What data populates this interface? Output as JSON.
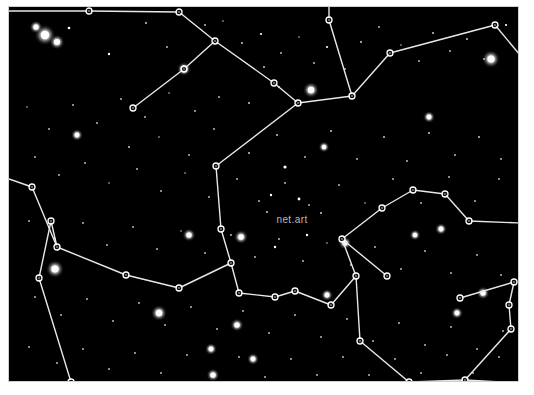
{
  "image": {
    "title": "net.art constellation star chart",
    "width": 534,
    "height": 395,
    "background_color": "#ffffff",
    "sky_color": "#000000",
    "frame_color": "#cfcfcf",
    "line_color": "#e8e8e8",
    "node_stroke_color": "#ffffff",
    "star_color": "#ffffff",
    "label_color": "#b9b9b9"
  },
  "frame": {
    "x": 8,
    "y": 6,
    "width": 511,
    "height": 376
  },
  "labels": [
    {
      "text": "net.art",
      "x": 283,
      "y": 216,
      "size": 10,
      "anchor": "middle"
    }
  ],
  "chart_data": {
    "type": "scatter",
    "title": "net.art",
    "xlabel": "",
    "ylabel": "",
    "xlim": [
      0,
      511
    ],
    "ylim": [
      0,
      376
    ],
    "grid": false,
    "legend": null,
    "nodes": [
      {
        "id": "n1",
        "x": 80,
        "y": 4
      },
      {
        "id": "n2",
        "x": 170,
        "y": 5
      },
      {
        "id": "n3",
        "x": 206,
        "y": 34
      },
      {
        "id": "n4",
        "x": 175,
        "y": 62
      },
      {
        "id": "n5",
        "x": 124,
        "y": 101
      },
      {
        "id": "n6",
        "x": 265,
        "y": 76
      },
      {
        "id": "n7",
        "x": 289,
        "y": 96
      },
      {
        "id": "n8",
        "x": 343,
        "y": 89
      },
      {
        "id": "n9",
        "x": 320,
        "y": 13
      },
      {
        "id": "n10",
        "x": 381,
        "y": 46
      },
      {
        "id": "n11",
        "x": 486,
        "y": 18
      },
      {
        "id": "n12",
        "x": 207,
        "y": 159
      },
      {
        "id": "n13",
        "x": 212,
        "y": 222
      },
      {
        "id": "n14",
        "x": 222,
        "y": 256
      },
      {
        "id": "n15",
        "x": 230,
        "y": 286
      },
      {
        "id": "n16",
        "x": 266,
        "y": 290
      },
      {
        "id": "n17",
        "x": 286,
        "y": 284
      },
      {
        "id": "n18",
        "x": 170,
        "y": 281
      },
      {
        "id": "n19",
        "x": 117,
        "y": 268
      },
      {
        "id": "n20",
        "x": 48,
        "y": 240
      },
      {
        "id": "n21",
        "x": 42,
        "y": 214
      },
      {
        "id": "n22",
        "x": 30,
        "y": 271
      },
      {
        "id": "n23",
        "x": 23,
        "y": 180
      },
      {
        "id": "n24",
        "x": 62,
        "y": 375
      },
      {
        "id": "n25",
        "x": 322,
        "y": 298
      },
      {
        "id": "n26",
        "x": 347,
        "y": 269
      },
      {
        "id": "n27",
        "x": 333,
        "y": 232
      },
      {
        "id": "n28",
        "x": 373,
        "y": 201
      },
      {
        "id": "n29",
        "x": 404,
        "y": 183
      },
      {
        "id": "n30",
        "x": 436,
        "y": 187
      },
      {
        "id": "n31",
        "x": 460,
        "y": 214
      },
      {
        "id": "n32",
        "x": 378,
        "y": 269
      },
      {
        "id": "n33",
        "x": 351,
        "y": 334
      },
      {
        "id": "n34",
        "x": 400,
        "y": 375
      },
      {
        "id": "n35",
        "x": 456,
        "y": 373
      },
      {
        "id": "n36",
        "x": 502,
        "y": 322
      },
      {
        "id": "n37",
        "x": 500,
        "y": 298
      },
      {
        "id": "n38",
        "x": 505,
        "y": 275
      },
      {
        "id": "n39",
        "x": 451,
        "y": 291
      }
    ],
    "edges": [
      [
        "n1",
        "n2"
      ],
      [
        "n2",
        "n3"
      ],
      [
        "n3",
        "n4"
      ],
      [
        "n4",
        "n5"
      ],
      [
        "n3",
        "n6"
      ],
      [
        "n6",
        "n7"
      ],
      [
        "n7",
        "n8"
      ],
      [
        "n8",
        "n9"
      ],
      [
        "n8",
        "n10"
      ],
      [
        "n10",
        "n11"
      ],
      [
        "n7",
        "n12"
      ],
      [
        "n12",
        "n13"
      ],
      [
        "n13",
        "n14"
      ],
      [
        "n14",
        "n15"
      ],
      [
        "n15",
        "n16"
      ],
      [
        "n16",
        "n17"
      ],
      [
        "n14",
        "n18"
      ],
      [
        "n18",
        "n19"
      ],
      [
        "n19",
        "n20"
      ],
      [
        "n20",
        "n21"
      ],
      [
        "n21",
        "n22"
      ],
      [
        "n20",
        "n23"
      ],
      [
        "n22",
        "n24"
      ],
      [
        "n17",
        "n25"
      ],
      [
        "n25",
        "n26"
      ],
      [
        "n26",
        "n27"
      ],
      [
        "n27",
        "n28"
      ],
      [
        "n28",
        "n29"
      ],
      [
        "n29",
        "n30"
      ],
      [
        "n30",
        "n31"
      ],
      [
        "n27",
        "n32"
      ],
      [
        "n26",
        "n33"
      ],
      [
        "n33",
        "n34"
      ],
      [
        "n34",
        "n35"
      ],
      [
        "n35",
        "n36"
      ],
      [
        "n36",
        "n37"
      ],
      [
        "n37",
        "n38"
      ],
      [
        "n38",
        "n39"
      ]
    ],
    "edges_to_border": [
      {
        "from": "n1",
        "to_x": 0,
        "to_y": 4
      },
      {
        "from": "n23",
        "to_x": 0,
        "to_y": 172
      },
      {
        "from": "n24",
        "to_x": 40,
        "to_y": 376
      },
      {
        "from": "n31",
        "to_x": 511,
        "to_y": 216
      },
      {
        "from": "n11",
        "to_x": 511,
        "to_y": 48
      },
      {
        "from": "n9",
        "to_x": 320,
        "to_y": 0
      },
      {
        "from": "n35",
        "to_x": 511,
        "to_y": 376
      }
    ],
    "stars": [
      {
        "x": 36,
        "y": 28,
        "r": 4.2
      },
      {
        "x": 27,
        "y": 20,
        "r": 2.6
      },
      {
        "x": 48,
        "y": 35,
        "r": 3.0
      },
      {
        "x": 60,
        "y": 21,
        "r": 1.3
      },
      {
        "x": 100,
        "y": 47,
        "r": 1.2
      },
      {
        "x": 137,
        "y": 16,
        "r": 1.0
      },
      {
        "x": 158,
        "y": 40,
        "r": 0.9
      },
      {
        "x": 175,
        "y": 62,
        "r": 2.8
      },
      {
        "x": 196,
        "y": 18,
        "r": 0.9
      },
      {
        "x": 214,
        "y": 14,
        "r": 0.8
      },
      {
        "x": 233,
        "y": 36,
        "r": 1.0
      },
      {
        "x": 252,
        "y": 27,
        "r": 1.1
      },
      {
        "x": 255,
        "y": 60,
        "r": 1.0
      },
      {
        "x": 272,
        "y": 46,
        "r": 0.9
      },
      {
        "x": 290,
        "y": 30,
        "r": 0.8
      },
      {
        "x": 305,
        "y": 56,
        "r": 0.9
      },
      {
        "x": 318,
        "y": 40,
        "r": 1.1
      },
      {
        "x": 336,
        "y": 62,
        "r": 0.9
      },
      {
        "x": 352,
        "y": 35,
        "r": 1.0
      },
      {
        "x": 370,
        "y": 20,
        "r": 0.9
      },
      {
        "x": 392,
        "y": 38,
        "r": 0.8
      },
      {
        "x": 410,
        "y": 54,
        "r": 0.9
      },
      {
        "x": 424,
        "y": 26,
        "r": 1.0
      },
      {
        "x": 441,
        "y": 44,
        "r": 0.9
      },
      {
        "x": 458,
        "y": 32,
        "r": 1.0
      },
      {
        "x": 475,
        "y": 52,
        "r": 0.9
      },
      {
        "x": 482,
        "y": 52,
        "r": 3.6
      },
      {
        "x": 497,
        "y": 18,
        "r": 1.1
      },
      {
        "x": 302,
        "y": 83,
        "r": 3.2
      },
      {
        "x": 270,
        "y": 80,
        "r": 1.0
      },
      {
        "x": 240,
        "y": 96,
        "r": 1.0
      },
      {
        "x": 210,
        "y": 90,
        "r": 0.9
      },
      {
        "x": 186,
        "y": 104,
        "r": 0.9
      },
      {
        "x": 160,
        "y": 86,
        "r": 0.8
      },
      {
        "x": 136,
        "y": 110,
        "r": 0.9
      },
      {
        "x": 112,
        "y": 92,
        "r": 0.9
      },
      {
        "x": 88,
        "y": 116,
        "r": 0.9
      },
      {
        "x": 64,
        "y": 98,
        "r": 0.9
      },
      {
        "x": 40,
        "y": 122,
        "r": 0.9
      },
      {
        "x": 18,
        "y": 100,
        "r": 0.8
      },
      {
        "x": 68,
        "y": 128,
        "r": 2.4
      },
      {
        "x": 120,
        "y": 140,
        "r": 1.0
      },
      {
        "x": 150,
        "y": 130,
        "r": 0.8
      },
      {
        "x": 180,
        "y": 148,
        "r": 0.9
      },
      {
        "x": 205,
        "y": 122,
        "r": 0.9
      },
      {
        "x": 240,
        "y": 146,
        "r": 1.0
      },
      {
        "x": 268,
        "y": 128,
        "r": 1.0
      },
      {
        "x": 296,
        "y": 150,
        "r": 0.9
      },
      {
        "x": 322,
        "y": 124,
        "r": 1.0
      },
      {
        "x": 315,
        "y": 140,
        "r": 2.2
      },
      {
        "x": 348,
        "y": 152,
        "r": 0.9
      },
      {
        "x": 375,
        "y": 130,
        "r": 1.0
      },
      {
        "x": 398,
        "y": 154,
        "r": 0.9
      },
      {
        "x": 420,
        "y": 126,
        "r": 1.0
      },
      {
        "x": 446,
        "y": 148,
        "r": 0.9
      },
      {
        "x": 470,
        "y": 130,
        "r": 1.0
      },
      {
        "x": 492,
        "y": 152,
        "r": 0.9
      },
      {
        "x": 420,
        "y": 110,
        "r": 2.4
      },
      {
        "x": 26,
        "y": 150,
        "r": 0.9
      },
      {
        "x": 50,
        "y": 168,
        "r": 0.9
      },
      {
        "x": 76,
        "y": 156,
        "r": 0.9
      },
      {
        "x": 100,
        "y": 176,
        "r": 0.8
      },
      {
        "x": 128,
        "y": 162,
        "r": 0.9
      },
      {
        "x": 152,
        "y": 184,
        "r": 0.9
      },
      {
        "x": 176,
        "y": 166,
        "r": 0.8
      },
      {
        "x": 200,
        "y": 190,
        "r": 0.9
      },
      {
        "x": 228,
        "y": 172,
        "r": 0.9
      },
      {
        "x": 250,
        "y": 194,
        "r": 0.9
      },
      {
        "x": 276,
        "y": 176,
        "r": 0.9
      },
      {
        "x": 300,
        "y": 198,
        "r": 0.9
      },
      {
        "x": 258,
        "y": 205,
        "r": 1.0
      },
      {
        "x": 312,
        "y": 206,
        "r": 1.0
      },
      {
        "x": 330,
        "y": 178,
        "r": 0.9
      },
      {
        "x": 356,
        "y": 196,
        "r": 0.8
      },
      {
        "x": 384,
        "y": 172,
        "r": 0.9
      },
      {
        "x": 412,
        "y": 196,
        "r": 0.9
      },
      {
        "x": 440,
        "y": 170,
        "r": 0.9
      },
      {
        "x": 466,
        "y": 194,
        "r": 0.9
      },
      {
        "x": 490,
        "y": 172,
        "r": 0.9
      },
      {
        "x": 432,
        "y": 222,
        "r": 2.4
      },
      {
        "x": 20,
        "y": 214,
        "r": 0.9
      },
      {
        "x": 46,
        "y": 232,
        "r": 0.9
      },
      {
        "x": 74,
        "y": 216,
        "r": 0.9
      },
      {
        "x": 98,
        "y": 238,
        "r": 0.9
      },
      {
        "x": 124,
        "y": 220,
        "r": 0.9
      },
      {
        "x": 148,
        "y": 242,
        "r": 0.9
      },
      {
        "x": 172,
        "y": 224,
        "r": 0.8
      },
      {
        "x": 196,
        "y": 246,
        "r": 0.9
      },
      {
        "x": 222,
        "y": 228,
        "r": 0.9
      },
      {
        "x": 246,
        "y": 250,
        "r": 0.9
      },
      {
        "x": 270,
        "y": 232,
        "r": 0.9
      },
      {
        "x": 294,
        "y": 254,
        "r": 0.9
      },
      {
        "x": 318,
        "y": 236,
        "r": 0.8
      },
      {
        "x": 342,
        "y": 258,
        "r": 0.9
      },
      {
        "x": 366,
        "y": 240,
        "r": 0.9
      },
      {
        "x": 392,
        "y": 262,
        "r": 0.9
      },
      {
        "x": 416,
        "y": 244,
        "r": 0.9
      },
      {
        "x": 442,
        "y": 266,
        "r": 0.9
      },
      {
        "x": 468,
        "y": 248,
        "r": 0.9
      },
      {
        "x": 492,
        "y": 268,
        "r": 0.9
      },
      {
        "x": 232,
        "y": 230,
        "r": 2.8
      },
      {
        "x": 336,
        "y": 236,
        "r": 2.6
      },
      {
        "x": 406,
        "y": 228,
        "r": 2.2
      },
      {
        "x": 46,
        "y": 262,
        "r": 3.6
      },
      {
        "x": 180,
        "y": 228,
        "r": 2.6
      },
      {
        "x": 26,
        "y": 290,
        "r": 0.9
      },
      {
        "x": 52,
        "y": 308,
        "r": 0.9
      },
      {
        "x": 78,
        "y": 292,
        "r": 0.9
      },
      {
        "x": 104,
        "y": 314,
        "r": 0.9
      },
      {
        "x": 130,
        "y": 296,
        "r": 0.9
      },
      {
        "x": 156,
        "y": 318,
        "r": 0.9
      },
      {
        "x": 150,
        "y": 306,
        "r": 3.2
      },
      {
        "x": 182,
        "y": 300,
        "r": 0.9
      },
      {
        "x": 208,
        "y": 322,
        "r": 0.9
      },
      {
        "x": 202,
        "y": 342,
        "r": 2.4
      },
      {
        "x": 234,
        "y": 304,
        "r": 0.9
      },
      {
        "x": 228,
        "y": 318,
        "r": 2.6
      },
      {
        "x": 260,
        "y": 326,
        "r": 0.9
      },
      {
        "x": 286,
        "y": 308,
        "r": 0.9
      },
      {
        "x": 312,
        "y": 330,
        "r": 0.9
      },
      {
        "x": 338,
        "y": 312,
        "r": 0.9
      },
      {
        "x": 364,
        "y": 334,
        "r": 0.9
      },
      {
        "x": 390,
        "y": 316,
        "r": 0.9
      },
      {
        "x": 416,
        "y": 338,
        "r": 0.9
      },
      {
        "x": 442,
        "y": 320,
        "r": 0.9
      },
      {
        "x": 468,
        "y": 342,
        "r": 0.9
      },
      {
        "x": 494,
        "y": 324,
        "r": 0.9
      },
      {
        "x": 318,
        "y": 288,
        "r": 2.4
      },
      {
        "x": 448,
        "y": 306,
        "r": 2.4
      },
      {
        "x": 474,
        "y": 286,
        "r": 2.6
      },
      {
        "x": 20,
        "y": 340,
        "r": 0.9
      },
      {
        "x": 48,
        "y": 356,
        "r": 0.9
      },
      {
        "x": 74,
        "y": 342,
        "r": 0.9
      },
      {
        "x": 100,
        "y": 362,
        "r": 0.9
      },
      {
        "x": 126,
        "y": 346,
        "r": 0.9
      },
      {
        "x": 152,
        "y": 366,
        "r": 0.9
      },
      {
        "x": 178,
        "y": 348,
        "r": 0.9
      },
      {
        "x": 204,
        "y": 368,
        "r": 2.6
      },
      {
        "x": 230,
        "y": 350,
        "r": 0.9
      },
      {
        "x": 256,
        "y": 370,
        "r": 0.9
      },
      {
        "x": 244,
        "y": 352,
        "r": 2.4
      },
      {
        "x": 282,
        "y": 352,
        "r": 0.9
      },
      {
        "x": 308,
        "y": 368,
        "r": 0.9
      },
      {
        "x": 334,
        "y": 350,
        "r": 0.9
      },
      {
        "x": 360,
        "y": 368,
        "r": 0.9
      },
      {
        "x": 386,
        "y": 352,
        "r": 0.9
      },
      {
        "x": 412,
        "y": 366,
        "r": 0.9
      },
      {
        "x": 438,
        "y": 348,
        "r": 0.9
      },
      {
        "x": 464,
        "y": 366,
        "r": 0.9
      },
      {
        "x": 490,
        "y": 350,
        "r": 0.9
      },
      {
        "x": 276,
        "y": 160,
        "r": 1.6
      },
      {
        "x": 290,
        "y": 192,
        "r": 1.4
      },
      {
        "x": 262,
        "y": 188,
        "r": 1.2
      },
      {
        "x": 298,
        "y": 228,
        "r": 1.2
      },
      {
        "x": 266,
        "y": 240,
        "r": 1.2
      }
    ]
  }
}
